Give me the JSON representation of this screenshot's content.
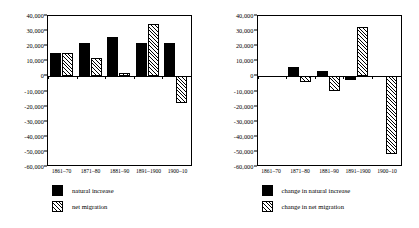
{
  "chart_data": [
    {
      "type": "bar",
      "id": "left",
      "title": "",
      "xlabel": "",
      "ylabel": "",
      "ylim": [
        -60000,
        40000
      ],
      "ytick_step": 10000,
      "yticks": [
        "40,000",
        "30,000",
        "20,000",
        "10,000",
        "0",
        "-10,000",
        "-20,000",
        "-30,000",
        "-40,000",
        "-50,000",
        "-60,000"
      ],
      "ytick_values": [
        40000,
        30000,
        20000,
        10000,
        0,
        -10000,
        -20000,
        -30000,
        -40000,
        -50000,
        -60000
      ],
      "grid": false,
      "legend_position": "bottom-left",
      "categories": [
        "1861–70",
        "1871–80",
        "1881–90",
        "1891–1900",
        "1900–10"
      ],
      "series": [
        {
          "name": "natural increase",
          "style": "solid",
          "values": [
            15500,
            22000,
            26000,
            22000,
            22000
          ]
        },
        {
          "name": "net migration",
          "style": "hatch",
          "values": [
            15800,
            12000,
            2000,
            34500,
            -17500
          ]
        }
      ]
    },
    {
      "type": "bar",
      "id": "right",
      "title": "",
      "xlabel": "",
      "ylabel": "",
      "ylim": [
        -60000,
        40000
      ],
      "ytick_step": 10000,
      "yticks": [
        "40,000",
        "30,000",
        "20,000",
        "10,000",
        "0",
        "-10,000",
        "-20,000",
        "-30,000",
        "-40,000",
        "-50,000",
        "-60,000"
      ],
      "ytick_values": [
        40000,
        30000,
        20000,
        10000,
        0,
        -10000,
        -20000,
        -30000,
        -40000,
        -50000,
        -60000
      ],
      "grid": false,
      "legend_position": "bottom-left",
      "categories": [
        "1861–70",
        "1871–80",
        "1881–90",
        "1891–1900",
        "1900–10"
      ],
      "series": [
        {
          "name": "change in natural increase",
          "style": "solid",
          "values": [
            0,
            6000,
            3500,
            -2500,
            0
          ]
        },
        {
          "name": "change in net migration",
          "style": "hatch",
          "values": [
            0,
            -3500,
            -9800,
            32500,
            -51500
          ]
        }
      ]
    }
  ]
}
